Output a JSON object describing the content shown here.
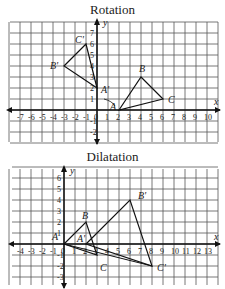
{
  "charts": [
    {
      "title": "Rotation",
      "x_axis_label": "x",
      "y_axis_label": "y",
      "x_ticks": [
        "-7",
        "-6",
        "-5",
        "-4",
        "-3",
        "-2",
        "-1",
        "0",
        "1",
        "2",
        "3",
        "4",
        "5",
        "6",
        "7",
        "8",
        "9",
        "10"
      ],
      "y_ticks": [
        "-2",
        "-1",
        "1",
        "2",
        "3",
        "4",
        "5",
        "6",
        "7"
      ],
      "original": {
        "A": [
          2,
          0
        ],
        "B": [
          4,
          3
        ],
        "C": [
          6,
          1
        ]
      },
      "image": {
        "A'": [
          0,
          2
        ],
        "B'": [
          -3,
          4
        ],
        "C'": [
          -1,
          6
        ]
      },
      "labels": {
        "A": "A",
        "B": "B",
        "C": "C",
        "A1": "A'",
        "B1": "B'",
        "C1": "C'"
      }
    },
    {
      "title": "Dilatation",
      "x_axis_label": "x",
      "y_axis_label": "y",
      "x_ticks": [
        "-4",
        "-3",
        "-2",
        "-1",
        "0",
        "1",
        "2",
        "3",
        "4",
        "5",
        "6",
        "7",
        "8",
        "9",
        "10",
        "11",
        "12",
        "13"
      ],
      "y_ticks": [
        "-3",
        "-2",
        "-1",
        "1",
        "2",
        "3",
        "4",
        "5",
        "6"
      ],
      "original": {
        "A": [
          0,
          0
        ],
        "B": [
          2,
          2
        ],
        "C": [
          3,
          -1
        ]
      },
      "image": {
        "A'": [
          2,
          0
        ],
        "B'": [
          6,
          4
        ],
        "C'": [
          8,
          -2
        ]
      },
      "labels": {
        "A": "A",
        "B": "B",
        "C": "C",
        "A1": "A'",
        "B1": "B'",
        "C1": "C'"
      }
    }
  ]
}
